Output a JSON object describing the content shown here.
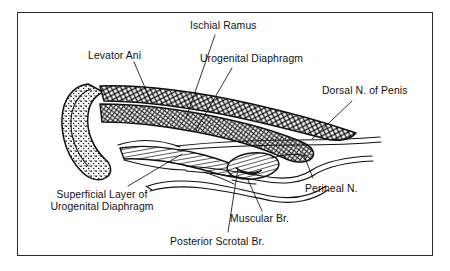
{
  "figure": {
    "border_color": "#2b2b2b",
    "ink_color": "#111111",
    "background_color": "#ffffff"
  },
  "labels": [
    {
      "id": "ischial-ramus",
      "text": "Ischial Ramus"
    },
    {
      "id": "levator-ani",
      "text": "Levator Ani"
    },
    {
      "id": "urogenital-diaphragm",
      "text": "Urogenital Diaphragm"
    },
    {
      "id": "dorsal-n-of-penis",
      "text": "Dorsal N. of Penis"
    },
    {
      "id": "superficial-layer-1",
      "text": "Superficial Layer of"
    },
    {
      "id": "superficial-layer-2",
      "text": "Urogenital Diaphragm"
    },
    {
      "id": "perineal-n",
      "text": "Perineal N."
    },
    {
      "id": "muscular-br",
      "text": "Muscular Br."
    },
    {
      "id": "posterior-scrotal-br",
      "text": "Posterior Scrotal Br."
    }
  ],
  "structures": [
    {
      "id": "ischial-ramus-bone",
      "name": "Ischial ramus bone",
      "texture": "stippled"
    },
    {
      "id": "levator-ani-muscle",
      "name": "Levator ani muscle band",
      "texture": "cross-hatch"
    },
    {
      "id": "urogenital-diaphragm-muscle",
      "name": "Urogenital diaphragm muscle band",
      "texture": "cross-hatch"
    },
    {
      "id": "superficial-layer-band",
      "name": "Superficial layer of urogenital diaphragm",
      "texture": "striated"
    },
    {
      "id": "bulb-structure",
      "name": "Oval bulb structure",
      "texture": "striated"
    },
    {
      "id": "dorsal-nerve-line",
      "name": "Dorsal nerve of penis",
      "texture": "line"
    },
    {
      "id": "perineal-nerve-line",
      "name": "Perineal nerve trunk",
      "texture": "line"
    },
    {
      "id": "muscular-branch-line",
      "name": "Muscular branch",
      "texture": "line"
    },
    {
      "id": "posterior-scrotal-line",
      "name": "Posterior scrotal branch",
      "texture": "line"
    }
  ]
}
